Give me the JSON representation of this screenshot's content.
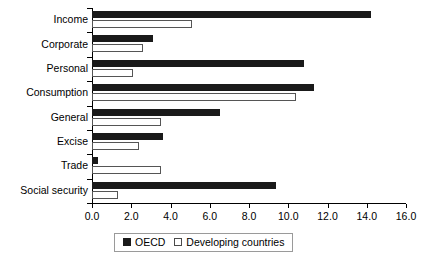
{
  "chart_data": {
    "type": "bar",
    "orientation": "horizontal",
    "title": "",
    "xlabel": "",
    "ylabel": "",
    "xlim": [
      0.0,
      16.0
    ],
    "xticks": [
      "0.0",
      "2.0",
      "4.0",
      "6.0",
      "8.0",
      "10.0",
      "12.0",
      "14.0",
      "16.0"
    ],
    "grid": false,
    "legend_position": "bottom",
    "categories": [
      "Income",
      "Corporate",
      "Personal",
      "Consumption",
      "General",
      "Excise",
      "Trade",
      "Social security"
    ],
    "series": [
      {
        "name": "OECD",
        "color": "#1a1a1a",
        "values": [
          14.2,
          3.1,
          10.8,
          11.3,
          6.5,
          3.6,
          0.3,
          9.4
        ]
      },
      {
        "name": "Developing countries",
        "color": "#ffffff",
        "values": [
          5.1,
          2.6,
          2.1,
          10.4,
          3.5,
          2.4,
          3.5,
          1.3
        ]
      }
    ]
  },
  "legend": {
    "entries": [
      {
        "label": "OECD",
        "swatch": "filled-black-square"
      },
      {
        "label": "Developing countries",
        "swatch": "outlined-white-square"
      }
    ]
  }
}
